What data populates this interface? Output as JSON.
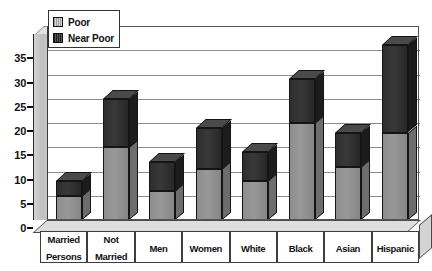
{
  "chart_data": {
    "type": "bar",
    "title": "",
    "subtitle": "",
    "xlabel": "",
    "ylabel": "",
    "ylim": [
      0,
      40
    ],
    "yticks": [
      0,
      5,
      10,
      15,
      20,
      25,
      30,
      35
    ],
    "ytick_labels": [
      "0",
      "5",
      "10",
      "15",
      "20",
      "25",
      "30",
      "35"
    ],
    "grid": true,
    "stacked": true,
    "three_d": true,
    "legend_position": "top-left",
    "categories": [
      "Married Persons",
      "Not Married",
      "Men",
      "Women",
      "White",
      "Black",
      "Asian",
      "Hispanic"
    ],
    "category_lines": [
      [
        "Married",
        "Persons"
      ],
      [
        "Not",
        "Married"
      ],
      [
        "Men"
      ],
      [
        "Women"
      ],
      [
        "White"
      ],
      [
        "Black"
      ],
      [
        "Asian"
      ],
      [
        "Hispanic"
      ]
    ],
    "series": [
      {
        "name": "Poor",
        "color": "#8e8e8e",
        "values": [
          5,
          15,
          6,
          10.5,
          8,
          20,
          11,
          18
        ]
      },
      {
        "name": "Near Poor",
        "color": "#2e2e2e",
        "values": [
          3,
          10,
          6,
          8.5,
          6,
          9,
          7,
          18
        ]
      }
    ],
    "totals": [
      8,
      25,
      12,
      19,
      14,
      29,
      18,
      36
    ]
  },
  "legend": {
    "items": [
      {
        "label": "Poor",
        "swatch": "poor-swatch"
      },
      {
        "label": "Near Poor",
        "swatch": "near-poor-swatch"
      }
    ]
  }
}
